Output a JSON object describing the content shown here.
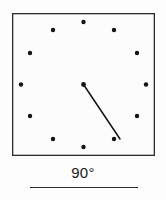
{
  "figure": {
    "name": "clock-angle-diagram",
    "caption": "90°",
    "frame": {
      "x": 12,
      "y": 13,
      "width": 143,
      "height": 143,
      "stroke_color": "#2b2b2b",
      "fill_color": "#fcfcfc"
    },
    "center": {
      "x": 83.5,
      "y": 84.5
    },
    "dot_color": "#141414",
    "dot_radius": 2.2,
    "hour_marks": [
      {
        "hour": 12,
        "label": "12",
        "x": 83.5,
        "y": 22
      },
      {
        "hour": 1,
        "label": "1",
        "x": 114,
        "y": 30
      },
      {
        "hour": 2,
        "label": "2",
        "x": 137,
        "y": 53
      },
      {
        "hour": 3,
        "label": "3",
        "x": 146,
        "y": 84.5
      },
      {
        "hour": 4,
        "label": "4",
        "x": 137,
        "y": 116
      },
      {
        "hour": 5,
        "label": "5",
        "x": 114,
        "y": 139
      },
      {
        "hour": 6,
        "label": "6",
        "x": 83.5,
        "y": 147
      },
      {
        "hour": 7,
        "label": "7",
        "x": 53,
        "y": 139
      },
      {
        "hour": 8,
        "label": "8",
        "x": 30,
        "y": 116
      },
      {
        "hour": 9,
        "label": "9",
        "x": 21,
        "y": 84.5
      },
      {
        "hour": 10,
        "label": "10",
        "x": 30,
        "y": 53
      },
      {
        "hour": 11,
        "label": "11",
        "x": 53,
        "y": 30
      }
    ],
    "hand": {
      "name": "clock-hand",
      "from_x": 83.5,
      "from_y": 84.5,
      "to_x": 120,
      "to_y": 139,
      "stroke_color": "#141414",
      "stroke_width": 1.5
    },
    "rule": {
      "x": 30,
      "y": 187,
      "width": 108,
      "color": "#2b2b2b"
    }
  }
}
